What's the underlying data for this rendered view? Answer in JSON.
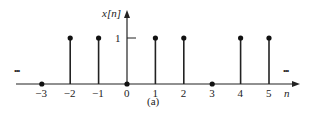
{
  "chart_data": {
    "type": "stem",
    "title": "",
    "caption": "(a)",
    "xlabel": "n",
    "ylabel": "x[n]",
    "x": [
      -3,
      -2,
      -1,
      0,
      1,
      2,
      3,
      4,
      5
    ],
    "values": [
      0,
      1,
      1,
      0,
      1,
      1,
      0,
      1,
      1
    ],
    "x_tick_labels": [
      "-3",
      "-2",
      "-1",
      "0",
      "1",
      "2",
      "3",
      "4",
      "5"
    ],
    "y_tick_labels": [
      "1"
    ],
    "ylim": [
      0,
      1
    ],
    "continuation": "... (sequence continues periodically in both directions)",
    "grid": false,
    "legend": null
  },
  "labels": {
    "ylabel": "x[n]",
    "xlabel": "n",
    "ytick_one": "1",
    "caption": "(a)",
    "ellipsis_left": "•••",
    "ellipsis_right": "•••",
    "ticks": [
      "−3",
      "−2",
      "−1",
      "0",
      "1",
      "2",
      "3",
      "4",
      "5"
    ]
  }
}
